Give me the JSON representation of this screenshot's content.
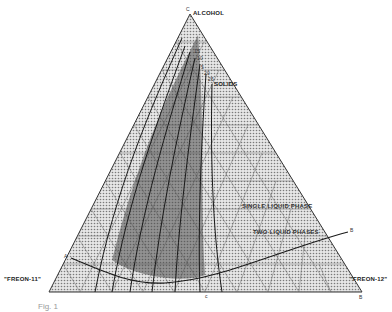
{
  "diagram": {
    "type": "ternary phase diagram",
    "vertices": {
      "top": {
        "letter": "C",
        "label": "ALCOHOL"
      },
      "left": {
        "letter": "A",
        "label": "\"FREON-11\""
      },
      "right": {
        "letter": "B",
        "label": "\"FREON-12\""
      }
    },
    "regions": {
      "single": "SINGLE LIQUID PHASE",
      "two": "TWO LIQUID PHASES"
    },
    "boundary_points": {
      "left": "A",
      "right": "B"
    },
    "bottom_mark": "c",
    "curve_labels": [
      "15",
      "10",
      "5",
      "20",
      "25",
      "SOLIDS"
    ],
    "edge_marks": {
      "left": "b",
      "right": "a"
    },
    "caption": "Fig. 1"
  },
  "colors": {
    "grid": "#8a8a8a",
    "fill": "#cfcfcf",
    "shade": "#555555",
    "ink": "#1a1a1a"
  }
}
